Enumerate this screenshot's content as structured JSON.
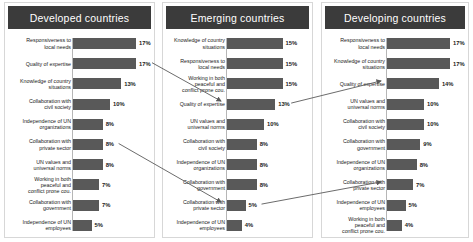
{
  "chart_data": {
    "type": "bar",
    "title": "",
    "xlabel": "",
    "ylabel": "",
    "grid": false,
    "legend": "none",
    "value_suffix": "%",
    "xlim": [
      0,
      18
    ],
    "panels": [
      {
        "title": "Developed countries",
        "categories": [
          "Responsiveness to\nlocal needs",
          "Quality of expertise",
          "Knowledge of country\nsituations",
          "Collaboration with\ncivil society",
          "Independence of UN\norganizations",
          "Collaboration with\nprivate sector",
          "UN values and\nuniversal norms",
          "Working in both\npeaceful and\nconflict prone cou.",
          "Collaboration with\ngovernment",
          "Independence of UN\nemployees"
        ],
        "values": [
          17,
          17,
          13,
          10,
          8,
          8,
          8,
          7,
          7,
          5
        ],
        "labels": [
          "17%",
          "17%",
          "13%",
          "10%",
          "8%",
          "8%",
          "8%",
          "7%",
          "7%",
          "5%"
        ]
      },
      {
        "title": "Emerging countries",
        "categories": [
          "Knowledge of country\nsituations",
          "Responsiveness to\nlocal needs",
          "Working in both\npeaceful and\nconflict prone cou.",
          "Quality of expertise",
          "UN values and\nuniversal norms",
          "Collaboration with\ncivil society",
          "Independence of UN\norganizations",
          "Collaboration with\ngovernment",
          "Collaboration with\nprivate sector",
          "Independence of UN\nemployees"
        ],
        "values": [
          15,
          15,
          15,
          13,
          10,
          8,
          8,
          8,
          5,
          4
        ],
        "labels": [
          "15%",
          "15%",
          "15%",
          "13%",
          "10%",
          "8%",
          "8%",
          "8%",
          "5%",
          "4%"
        ]
      },
      {
        "title": "Developing countries",
        "categories": [
          "Responsiveness to\nlocal needs",
          "Knowledge of country\nsituations",
          "Quality of expertise",
          "UN values and\nuniversal norms",
          "Collaboration with\ncivil society",
          "Collaboration with\ngovernment",
          "Independence of UN\norganizations",
          "Collaboration with\nprivate sector",
          "Independence of UN\nemployees",
          "Working in both\npeaceful and\nconflict prone cou."
        ],
        "values": [
          17,
          17,
          14,
          10,
          10,
          9,
          8,
          7,
          5,
          4
        ],
        "labels": [
          "17%",
          "17%",
          "14%",
          "10%",
          "10%",
          "9%",
          "8%",
          "7%",
          "5%",
          "4%"
        ]
      }
    ],
    "connectors": [
      {
        "from_panel": 0,
        "from_index": 1,
        "to_panel": 1,
        "to_index": 3,
        "category": "Quality of expertise"
      },
      {
        "from_panel": 0,
        "from_index": 5,
        "to_panel": 1,
        "to_index": 8,
        "category": "Collaboration with private sector"
      },
      {
        "from_panel": 1,
        "from_index": 3,
        "to_panel": 2,
        "to_index": 2,
        "category": "Quality of expertise"
      },
      {
        "from_panel": 1,
        "from_index": 8,
        "to_panel": 2,
        "to_index": 7,
        "category": "Collaboration with private sector"
      }
    ],
    "colors": {
      "bar": "#595959",
      "header_bg": "#3b3b3b",
      "header_text": "#ffffff",
      "panel_border": "#d7d7d7",
      "axis": "#b6b6b6",
      "arrow": "#5a5a5a"
    }
  }
}
